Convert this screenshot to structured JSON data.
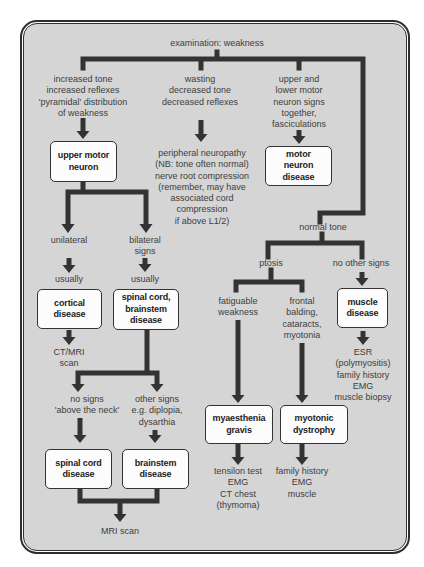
{
  "title": "examination: weakness",
  "upper_motor": {
    "criteria": "increased tone\nincreased reflexes\n'pyramidal' distribution\nof weakness",
    "box": "upper motor\nneuron",
    "unilateral": {
      "label": "unilateral",
      "qualifier": "usually",
      "box": "cortical\ndisease",
      "investigation": "CT/MRI\nscan"
    },
    "bilateral": {
      "label": "bilateral\nsigns",
      "qualifier": "usually",
      "box": "spinal cord,\nbrainstem\ndisease",
      "no_signs": {
        "label": "no signs\n'above the neck'",
        "box": "spinal cord\ndisease"
      },
      "other_signs": {
        "label": "other signs\ne.g. diplopia,\ndysarthia",
        "box": "brainstem\ndisease"
      },
      "investigation": "MRI scan"
    }
  },
  "lower_motor": {
    "criteria": "wasting\ndecreased tone\ndecreased reflexes",
    "outcome": "peripheral neuropathy\n(NB: tone often normal)\nnerve root compression\n(remember, may have\nassociated cord\ncompression\nif above L1/2)"
  },
  "mixed": {
    "criteria": "upper and\nlower motor\nneuron signs\ntogether,\nfasciculations",
    "box": "motor\nneuron\ndisease"
  },
  "normal_tone": {
    "label": "normal tone",
    "ptosis": {
      "label": "ptosis",
      "fatiguable": {
        "label": "fatiguable\nweakness",
        "box": "myaesthenia\ngravis",
        "investigation": "tensilon test\nEMG\nCT chest\n(thymoma)"
      },
      "frontal": {
        "label": "frontal\nbalding,\ncataracts,\nmyotonia",
        "box": "myotonic\ndystrophy",
        "investigation": "family history\nEMG\nmuscle"
      }
    },
    "no_other_signs": {
      "label": "no other signs",
      "box": "muscle\ndisease",
      "investigation": "ESR\n(polymyositis)\nfamily history\nEMG\nmuscle biopsy"
    }
  },
  "edges": [
    {
      "from": "examination: weakness",
      "to": "increased tone / pyramidal weakness"
    },
    {
      "from": "examination: weakness",
      "to": "wasting / decreased tone / decreased reflexes"
    },
    {
      "from": "examination: weakness",
      "to": "upper and lower motor neuron signs together"
    },
    {
      "from": "examination: weakness",
      "to": "normal tone"
    },
    {
      "from": "increased tone / pyramidal weakness",
      "to": "upper motor neuron"
    },
    {
      "from": "wasting / decreased tone / decreased reflexes",
      "to": "peripheral neuropathy / nerve root compression"
    },
    {
      "from": "upper and lower motor neuron signs together",
      "to": "motor neuron disease"
    },
    {
      "from": "upper motor neuron",
      "to": "unilateral"
    },
    {
      "from": "upper motor neuron",
      "to": "bilateral signs"
    },
    {
      "from": "unilateral",
      "to": "cortical disease"
    },
    {
      "from": "cortical disease",
      "to": "CT/MRI scan"
    },
    {
      "from": "bilateral signs",
      "to": "spinal cord, brainstem disease"
    },
    {
      "from": "spinal cord, brainstem disease",
      "to": "no signs 'above the neck'"
    },
    {
      "from": "spinal cord, brainstem disease",
      "to": "other signs"
    },
    {
      "from": "no signs 'above the neck'",
      "to": "spinal cord disease"
    },
    {
      "from": "other signs",
      "to": "brainstem disease"
    },
    {
      "from": "spinal cord disease",
      "to": "MRI scan"
    },
    {
      "from": "brainstem disease",
      "to": "MRI scan"
    },
    {
      "from": "normal tone",
      "to": "ptosis"
    },
    {
      "from": "normal tone",
      "to": "no other signs"
    },
    {
      "from": "ptosis",
      "to": "fatiguable weakness"
    },
    {
      "from": "ptosis",
      "to": "frontal balding, cataracts, myotonia"
    },
    {
      "from": "fatiguable weakness",
      "to": "myaesthenia gravis"
    },
    {
      "from": "frontal balding, cataracts, myotonia",
      "to": "myotonic dystrophy"
    },
    {
      "from": "no other signs",
      "to": "muscle disease"
    },
    {
      "from": "myaesthenia gravis",
      "to": "tensilon test / EMG / CT chest"
    },
    {
      "from": "myotonic dystrophy",
      "to": "family history / EMG / muscle"
    },
    {
      "from": "muscle disease",
      "to": "ESR / family history / EMG / muscle biopsy"
    }
  ],
  "colors": {
    "background_panel": "#d5d5d5",
    "line": "#333333",
    "box_fill": "#fcfcfc",
    "text": "#3d3d3d"
  }
}
